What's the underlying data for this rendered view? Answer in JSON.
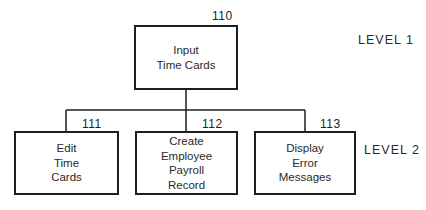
{
  "diagram": {
    "type": "hierarchy-chart",
    "root": {
      "id": "110",
      "label": "Input\nTime Cards"
    },
    "children": [
      {
        "id": "111",
        "label": "Edit\nTime\nCards"
      },
      {
        "id": "112",
        "label": "Create\nEmployee\nPayroll\nRecord"
      },
      {
        "id": "113",
        "label": "Display\nError\nMessages"
      }
    ],
    "levels": [
      {
        "label": "LEVEL 1"
      },
      {
        "label": "LEVEL 2"
      }
    ],
    "colors": {
      "line": "#1e1e1e",
      "text": "#2a2a2a",
      "background": "#ffffff"
    }
  }
}
